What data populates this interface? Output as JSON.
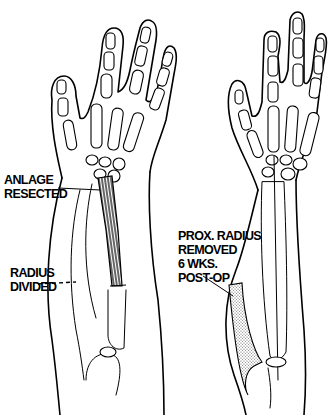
{
  "figure": {
    "left_panel": {
      "labels": [
        {
          "id": "anlage",
          "lines": [
            "ANLAGE",
            "RESECTED"
          ]
        },
        {
          "id": "radius_divided",
          "lines": [
            "RADIUS",
            "DIVIDED"
          ]
        }
      ]
    },
    "right_panel": {
      "labels": [
        {
          "id": "prox_radius",
          "lines": [
            "PROX. RADIUS",
            "REMOVED",
            "6 WKS.",
            "POST-OP"
          ]
        }
      ]
    },
    "colors": {
      "ink": "#000000",
      "background": "#ffffff",
      "stipple": "#c8c8c8"
    }
  }
}
